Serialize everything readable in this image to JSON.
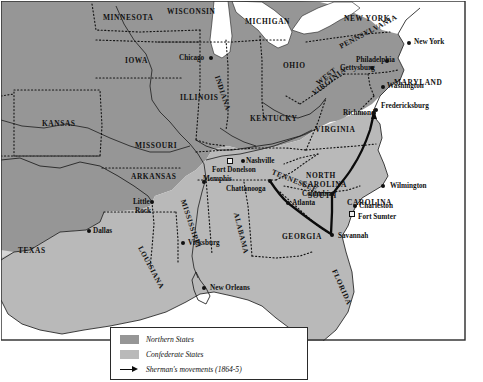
{
  "map": {
    "title": "American Civil War map",
    "colors": {
      "northern_states": "#969696",
      "confederate_states": "#b9b9b9",
      "territories": "#d6d6d6",
      "water": "#ffffff",
      "outline": "#1c1c1c",
      "sherman_route": "#0b0b0b"
    },
    "frame": {
      "visible": true
    }
  },
  "legend": {
    "items": [
      {
        "swatch": "#969696",
        "label": "Northern States",
        "symbol": "filled-square"
      },
      {
        "swatch": "#b9b9b9",
        "label": "Confederate States",
        "symbol": "filled-square"
      },
      {
        "swatch": "#0b0b0b",
        "label": "Sherman's movements (1864-5)",
        "symbol": "arrow"
      }
    ]
  },
  "states": [
    {
      "name": "MINNESOTA",
      "x": 103,
      "y": 14,
      "side": "north",
      "rotate": 0
    },
    {
      "name": "WISCONSIN",
      "x": 167,
      "y": 8,
      "side": "north",
      "rotate": 0
    },
    {
      "name": "MICHIGAN",
      "x": 245,
      "y": 18,
      "side": "north",
      "rotate": 0
    },
    {
      "name": "NEW YORK",
      "x": 344,
      "y": 15,
      "side": "north",
      "rotate": 0
    },
    {
      "name": "IOWA",
      "x": 125,
      "y": 57,
      "side": "north",
      "rotate": 0
    },
    {
      "name": "ILLINOIS",
      "x": 180,
      "y": 94,
      "side": "north",
      "rotate": 0
    },
    {
      "name": "INDIANA",
      "x": 217,
      "y": 72,
      "side": "north",
      "rotate": 72
    },
    {
      "name": "OHIO",
      "x": 283,
      "y": 62,
      "side": "north",
      "rotate": 0
    },
    {
      "name": "PENNSYLVANIA",
      "x": 340,
      "y": 43,
      "side": "north",
      "rotate": -28
    },
    {
      "name": "KANSAS",
      "x": 42,
      "y": 120,
      "side": "north",
      "rotate": 0
    },
    {
      "name": "MISSOURI",
      "x": 135,
      "y": 142,
      "side": "north",
      "rotate": 0
    },
    {
      "name": "KENTUCKY",
      "x": 250,
      "y": 115,
      "side": "north",
      "rotate": 0
    },
    {
      "name": "WEST",
      "x": 317,
      "y": 80,
      "side": "north",
      "rotate": -38
    },
    {
      "name": "VIRGINIA",
      "x": 313,
      "y": 90,
      "side": "north",
      "rotate": -38
    },
    {
      "name": "MARYLAND",
      "x": 394,
      "y": 79,
      "side": "north",
      "rotate": 0
    },
    {
      "name": "VIRGINIA",
      "x": 315,
      "y": 126,
      "side": "south",
      "rotate": 0
    },
    {
      "name": "ARKANSAS",
      "x": 131,
      "y": 173,
      "side": "south",
      "rotate": 0
    },
    {
      "name": "TEXAS",
      "x": 18,
      "y": 247,
      "side": "south",
      "rotate": 0
    },
    {
      "name": "LOUISIANA",
      "x": 140,
      "y": 243,
      "side": "south",
      "rotate": 62
    },
    {
      "name": "MISSISSIPPI",
      "x": 183,
      "y": 196,
      "side": "south",
      "rotate": 72
    },
    {
      "name": "ALABAMA",
      "x": 236,
      "y": 209,
      "side": "south",
      "rotate": 76
    },
    {
      "name": "TENNESSEE",
      "x": 272,
      "y": 168,
      "side": "south",
      "rotate": 22
    },
    {
      "name": "NORTH",
      "x": 306,
      "y": 172,
      "side": "south",
      "rotate": 0
    },
    {
      "name": "CAROLINA",
      "x": 302,
      "y": 181,
      "side": "south",
      "rotate": 0
    },
    {
      "name": "SOUTH",
      "x": 308,
      "y": 192,
      "side": "south",
      "rotate": 0
    },
    {
      "name": "CAROLINA",
      "x": 347,
      "y": 199,
      "side": "south",
      "rotate": 0
    },
    {
      "name": "GEORGIA",
      "x": 282,
      "y": 233,
      "side": "south",
      "rotate": 0
    },
    {
      "name": "FLORIDA",
      "x": 334,
      "y": 266,
      "side": "south",
      "rotate": 66
    }
  ],
  "cities": [
    {
      "name": "Chicago",
      "dot_x": 211,
      "dot_y": 58,
      "label_x": 179,
      "label_y": 55,
      "marker": "dot"
    },
    {
      "name": "New York",
      "dot_x": 409,
      "dot_y": 43,
      "label_x": 414,
      "label_y": 39,
      "marker": "dot"
    },
    {
      "name": "Philadelphia",
      "dot_x": 387,
      "dot_y": 61,
      "label_x": 356,
      "label_y": 57,
      "marker": "dot"
    },
    {
      "name": "Gettysburg",
      "dot_x": 372,
      "dot_y": 68,
      "label_x": 340,
      "label_y": 65,
      "marker": "dot"
    },
    {
      "name": "Washington",
      "dot_x": 383,
      "dot_y": 87,
      "label_x": 387,
      "label_y": 83,
      "marker": "dot"
    },
    {
      "name": "Fredericksburg",
      "dot_x": 376,
      "dot_y": 110,
      "label_x": 381,
      "label_y": 103,
      "marker": "dot"
    },
    {
      "name": "Richmond",
      "dot_x": 374,
      "dot_y": 113,
      "label_x": 343,
      "label_y": 110,
      "marker": "dot"
    },
    {
      "name": "Wilmington",
      "dot_x": 383,
      "dot_y": 186,
      "label_x": 390,
      "label_y": 183,
      "marker": "dot"
    },
    {
      "name": "Charleston",
      "dot_x": 355,
      "dot_y": 206,
      "label_x": 359,
      "label_y": 203,
      "marker": "dot"
    },
    {
      "name": "Fort Sumter",
      "dot_x": 352,
      "dot_y": 214,
      "label_x": 358,
      "label_y": 214,
      "marker": "square"
    },
    {
      "name": "Savannah",
      "dot_x": 332,
      "dot_y": 235,
      "label_x": 338,
      "label_y": 233,
      "marker": "dot"
    },
    {
      "name": "Columbia",
      "dot_x": 332,
      "dot_y": 194,
      "label_x": 302,
      "label_y": 191,
      "marker": "dot"
    },
    {
      "name": "Atlanta",
      "dot_x": 288,
      "dot_y": 203,
      "label_x": 292,
      "label_y": 200,
      "marker": "dot"
    },
    {
      "name": "Nashville",
      "dot_x": 243,
      "dot_y": 161,
      "label_x": 246,
      "label_y": 158,
      "marker": "dot"
    },
    {
      "name": "Fort Donelson",
      "dot_x": 230,
      "dot_y": 161,
      "label_x": 212,
      "label_y": 167,
      "marker": "square"
    },
    {
      "name": "Chattanooga",
      "dot_x": 270,
      "dot_y": 181,
      "label_x": 226,
      "label_y": 186,
      "marker": "dot"
    },
    {
      "name": "Memphis",
      "dot_x": 204,
      "dot_y": 182,
      "label_x": 203,
      "label_y": 176,
      "marker": "dot"
    },
    {
      "name": "Little",
      "dot_x": 152,
      "dot_y": 202,
      "label_x": 133,
      "label_y": 199,
      "marker": "dot"
    },
    {
      "name": "Rock",
      "dot_x": -1,
      "dot_y": -1,
      "label_x": 135,
      "label_y": 208,
      "marker": "none"
    },
    {
      "name": "Dallas",
      "dot_x": 89,
      "dot_y": 231,
      "label_x": 93,
      "label_y": 228,
      "marker": "dot"
    },
    {
      "name": "Vicksburg",
      "dot_x": 183,
      "dot_y": 243,
      "label_x": 188,
      "label_y": 240,
      "marker": "dot"
    },
    {
      "name": "New Orleans",
      "dot_x": 204,
      "dot_y": 288,
      "label_x": 210,
      "label_y": 285,
      "marker": "dot"
    }
  ],
  "sherman_route": {
    "label": "Sherman's movements (1864-5)",
    "years": "1864-5",
    "waypoints": [
      "Chattanooga",
      "Atlanta",
      "Savannah",
      "Columbia",
      "Richmond"
    ]
  }
}
